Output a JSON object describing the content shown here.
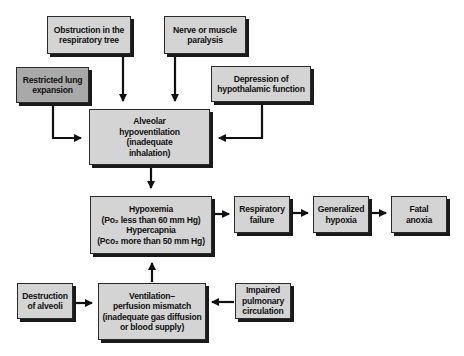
{
  "diagram": {
    "type": "flowchart",
    "nodes": {
      "obstruction": {
        "id": "obstruction",
        "lines": [
          "Obstruction in the",
          "respiratory tree"
        ]
      },
      "nerve": {
        "id": "nerve",
        "lines": [
          "Nerve or muscle",
          "paralysis"
        ]
      },
      "restricted": {
        "id": "restricted",
        "lines": [
          "Restricted lung",
          "expansion"
        ]
      },
      "depression": {
        "id": "depression",
        "lines": [
          "Depression of",
          "hypothalamic function"
        ]
      },
      "alveolar": {
        "id": "alveolar",
        "lines": [
          "Alveolar",
          "hypoventilation",
          "(inadequate",
          "inhalation)"
        ]
      },
      "hypoxemia": {
        "id": "hypoxemia",
        "lines": [
          "Hypoxemia",
          "(Po₂ less than 60 mm Hg)",
          "Hypercapnia",
          "(Pco₂ more than 50 mm Hg)"
        ]
      },
      "respiratory_failure": {
        "id": "respiratory_failure",
        "lines": [
          "Respiratory",
          "failure"
        ]
      },
      "generalized_hypoxia": {
        "id": "generalized_hypoxia",
        "lines": [
          "Generalized",
          "hypoxia"
        ]
      },
      "fatal_anoxia": {
        "id": "fatal_anoxia",
        "lines": [
          "Fatal",
          "anoxia"
        ]
      },
      "destruction": {
        "id": "destruction",
        "lines": [
          "Destruction",
          "of alveoli"
        ]
      },
      "ventilation": {
        "id": "ventilation",
        "lines": [
          "Ventilation–",
          "perfusion mismatch",
          "(inadequate gas diffusion",
          "or blood supply)"
        ]
      },
      "impaired": {
        "id": "impaired",
        "lines": [
          "Impaired",
          "pulmonary",
          "circulation"
        ]
      }
    },
    "edges": [
      {
        "from": "obstruction",
        "to": "alveolar"
      },
      {
        "from": "nerve",
        "to": "alveolar"
      },
      {
        "from": "restricted",
        "to": "alveolar"
      },
      {
        "from": "depression",
        "to": "alveolar"
      },
      {
        "from": "alveolar",
        "to": "hypoxemia"
      },
      {
        "from": "ventilation",
        "to": "hypoxemia"
      },
      {
        "from": "destruction",
        "to": "ventilation"
      },
      {
        "from": "impaired",
        "to": "ventilation"
      },
      {
        "from": "hypoxemia",
        "to": "respiratory_failure"
      },
      {
        "from": "respiratory_failure",
        "to": "generalized_hypoxia"
      },
      {
        "from": "generalized_hypoxia",
        "to": "fatal_anoxia"
      }
    ],
    "colors": {
      "box_fill": "#d4d4d4",
      "box_fill_dark": "#a9a9a9",
      "border": "#2a2a2a",
      "shadow": "#1a1a1a",
      "arrow": "#111111",
      "background": "#ffffff"
    }
  }
}
